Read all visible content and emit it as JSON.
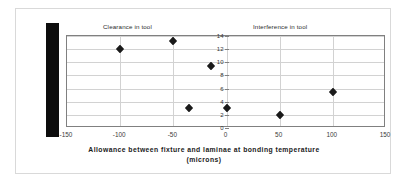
{
  "figure": {
    "axis_title_line1": "Allowance between fixture and laminae at bonding temperature",
    "axis_title_line2": "(microns)",
    "caption_left": "Clearance in tool",
    "caption_right": "Interference in tool",
    "frame_color": "#808080",
    "grid_color": "#d2d2d2",
    "marker_color": "#1a1a1a",
    "bar_color": "#0d0d0d"
  },
  "chart_data": {
    "type": "scatter",
    "title": "",
    "xlabel": "Allowance between fixture and laminae at bonding temperature (microns)",
    "ylabel": "",
    "xlim": [
      -150,
      150
    ],
    "ylim": [
      0,
      14
    ],
    "xticks": [
      -150,
      -100,
      -50,
      0,
      50,
      100,
      150
    ],
    "xtick_labels": [
      "-150",
      "-100",
      "-50",
      "0",
      "50",
      "100",
      "150"
    ],
    "yticks": [
      0,
      2,
      4,
      6,
      8,
      10,
      12,
      14
    ],
    "ytick_labels": [
      "0",
      "2",
      "4",
      "6",
      "8",
      "10",
      "12",
      "14"
    ],
    "grid": true,
    "legend": false,
    "annotations": [
      {
        "text": "Clearance in tool",
        "x": -75,
        "y": 15
      },
      {
        "text": "Interference in tool",
        "x": 70,
        "y": 15
      }
    ],
    "series": [
      {
        "name": "measurements",
        "marker": "diamond",
        "points": [
          {
            "x": -100,
            "y": 12.0
          },
          {
            "x": -50,
            "y": 13.2
          },
          {
            "x": -35,
            "y": 3.0
          },
          {
            "x": -15,
            "y": 9.4
          },
          {
            "x": 0,
            "y": 3.0
          },
          {
            "x": 50,
            "y": 2.0
          },
          {
            "x": 100,
            "y": 5.5
          }
        ]
      }
    ]
  }
}
